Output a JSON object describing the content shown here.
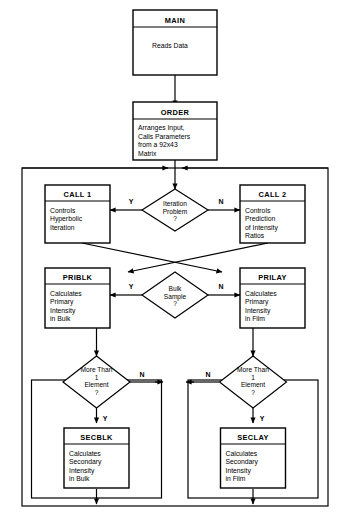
{
  "diagram": {
    "type": "flowchart",
    "background_color": "#ffffff",
    "line_color": "#000000"
  },
  "nodes": {
    "main": {
      "title": "MAIN",
      "body": [
        "Reads Data"
      ]
    },
    "order": {
      "title": "ORDER",
      "body": [
        "Arranges Input,",
        "Calls Parameters",
        "from a 92x43",
        "Matrix"
      ]
    },
    "call1": {
      "title": "CALL 1",
      "body": [
        "Controls",
        "Hyperbolic",
        "Iteration"
      ]
    },
    "call2": {
      "title": "CALL 2",
      "body": [
        "Controls",
        "Prediction",
        "of Intensity",
        "Ratios"
      ]
    },
    "priblk": {
      "title": "PRIBLK",
      "body": [
        "Calculates",
        "Primary",
        "Intensity",
        "in Bulk"
      ]
    },
    "prilay": {
      "title": "PRILAY",
      "body": [
        "Calculates",
        "Primary",
        "Intensity",
        "in Film"
      ]
    },
    "secblk": {
      "title": "SECBLK",
      "body": [
        "Calculates",
        "Secondary",
        "Intensity",
        "in Bulk"
      ]
    },
    "seclay": {
      "title": "SECLAY",
      "body": [
        "Calculates",
        "Secondary",
        "Intensity",
        "in Film"
      ]
    }
  },
  "decisions": {
    "iteration": {
      "lines": [
        "Iteration",
        "Problem",
        "?"
      ],
      "yes_label": "Y",
      "no_label": "N"
    },
    "bulk": {
      "lines": [
        "Bulk",
        "Sample",
        "?"
      ],
      "yes_label": "Y",
      "no_label": "N"
    },
    "more_elements_left": {
      "lines": [
        "More Than",
        "1",
        "Element",
        "?"
      ],
      "yes_label": "Y",
      "no_label": "N"
    },
    "more_elements_right": {
      "lines": [
        "More Than",
        "1",
        "Element",
        "?"
      ],
      "yes_label": "Y",
      "no_label": "N"
    }
  }
}
